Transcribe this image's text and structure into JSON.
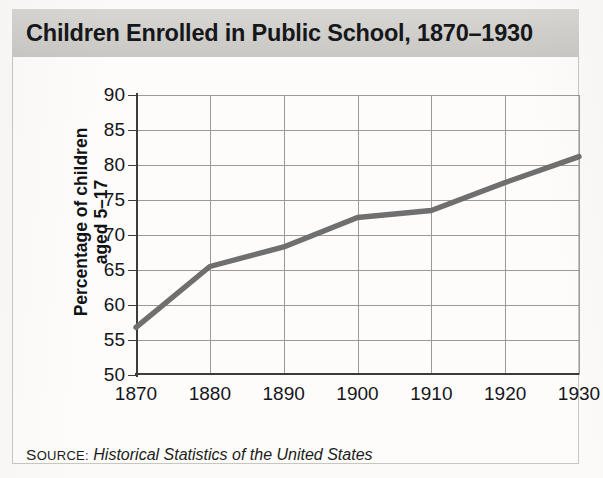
{
  "figure": {
    "title": "Children Enrolled in Public School, 1870–1930",
    "source_label": "SOURCE:",
    "source_label_cap": "S",
    "source_label_rest": "OURCE:",
    "source_text": "Historical Statistics of the United States"
  },
  "colors": {
    "banner": "#d2d1cd",
    "line": "#6f6f6f",
    "grid": "#9a9a98",
    "axis": "#3b3b3b",
    "text": "#15161a",
    "card_bg": "#fdfcfa"
  },
  "axes": {
    "ylabel_line1": "Percentage of children",
    "ylabel_line2": "aged 5–17",
    "yticks": [
      50,
      55,
      60,
      65,
      70,
      75,
      80,
      85,
      90
    ],
    "xticks": [
      1870,
      1880,
      1890,
      1900,
      1910,
      1920,
      1930
    ]
  },
  "chart_data": {
    "type": "line",
    "title": "Children Enrolled in Public School, 1870–1930",
    "xlabel": "",
    "ylabel": "Percentage of children aged 5–17",
    "x": [
      1870,
      1880,
      1890,
      1900,
      1910,
      1920,
      1930
    ],
    "values": [
      56.8,
      65.5,
      68.3,
      72.5,
      73.5,
      77.5,
      81.2
    ],
    "xlim": [
      1870,
      1930
    ],
    "ylim": [
      50,
      90
    ],
    "ytick_step": 5,
    "xtick_step": 10,
    "grid": true,
    "legend": "none",
    "series": [
      {
        "name": "Percentage of children aged 5–17 enrolled in public school",
        "values": [
          56.8,
          65.5,
          68.3,
          72.5,
          73.5,
          77.5,
          81.2
        ],
        "color": "#6f6f6f"
      }
    ],
    "source": "Historical Statistics of the United States"
  }
}
